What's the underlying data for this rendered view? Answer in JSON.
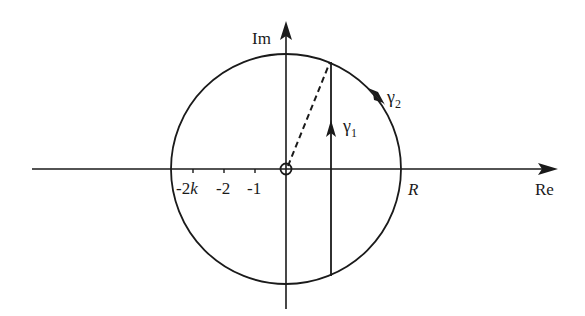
{
  "diagram": {
    "axes": {
      "real_label": "Re",
      "imag_label": "Im"
    },
    "tick_labels": [
      "-2k",
      "-2",
      "-1"
    ],
    "radius_label": "R",
    "contours": [
      {
        "name": "γ",
        "subscript": "1",
        "description": "vertical segment directed upward"
      },
      {
        "name": "γ",
        "subscript": "2",
        "description": "arc of circle directed clockwise"
      }
    ],
    "origin_marker": "circled point at origin",
    "dashed_segment": "from origin to top of γ1",
    "colors": {
      "stroke": "#1a1a1a",
      "background": "#ffffff"
    }
  }
}
